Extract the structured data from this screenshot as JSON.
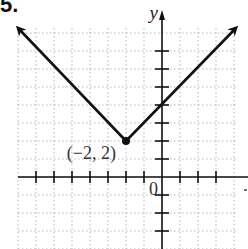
{
  "problem_number": "5.",
  "chart_data": {
    "type": "line",
    "title": "",
    "function": "y = |x + 2| + 2",
    "xlabel": "",
    "ylabel": "y",
    "origin_label": "0",
    "grid": true,
    "xlim": [
      -8,
      4
    ],
    "ylim": [
      -4,
      8
    ],
    "series": [
      {
        "name": "left-branch",
        "x": [
          -9,
          -2
        ],
        "y": [
          9,
          2
        ],
        "arrow": "start"
      },
      {
        "name": "right-branch",
        "x": [
          -2,
          4
        ],
        "y": [
          2,
          8
        ],
        "arrow": "end"
      }
    ],
    "points": [
      {
        "x": -2,
        "y": 2,
        "label": "(−2, 2)"
      }
    ],
    "colors": {
      "line": "#111111",
      "grid": "#b5b5b5",
      "axis": "#111111"
    }
  }
}
